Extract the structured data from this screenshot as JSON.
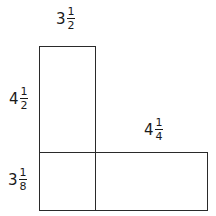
{
  "diagram": {
    "colors": {
      "stroke": "#2a2a2a",
      "text": "#1a1a1a",
      "background": "#ffffff"
    },
    "labels": {
      "top_width": {
        "whole": "3",
        "numerator": "1",
        "denominator": "2",
        "text": "3 1/2"
      },
      "left_upper_height": {
        "whole": "4",
        "numerator": "1",
        "denominator": "2",
        "text": "4 1/2"
      },
      "right_lower_width": {
        "whole": "4",
        "numerator": "1",
        "denominator": "4",
        "text": "4 1/4"
      },
      "left_lower_height": {
        "whole": "3",
        "numerator": "1",
        "denominator": "8",
        "text": "3 1/8"
      }
    },
    "shapes": [
      {
        "name": "tall-rectangle",
        "x": 39,
        "y": 46,
        "w": 57,
        "h": 165
      },
      {
        "name": "wide-rectangle",
        "x": 39,
        "y": 152,
        "w": 169,
        "h": 59
      }
    ]
  }
}
